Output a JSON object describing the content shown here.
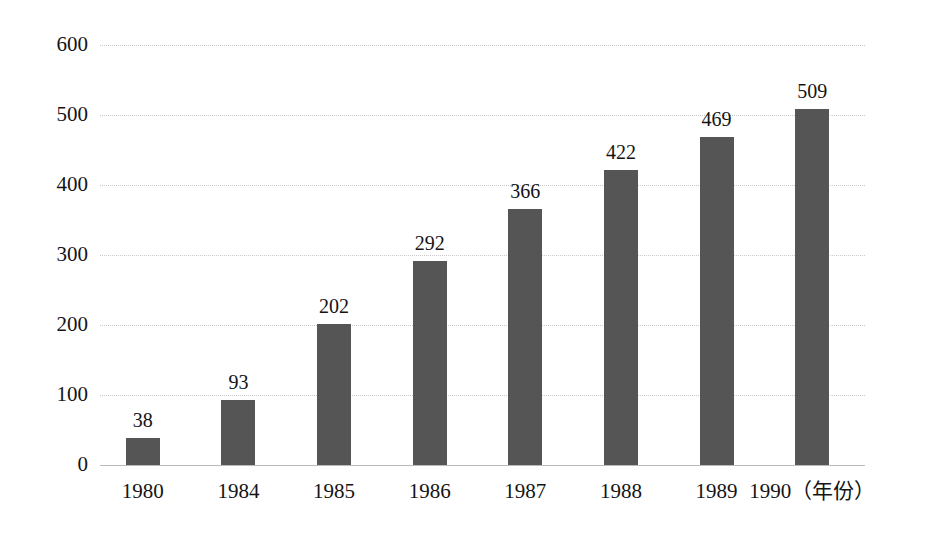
{
  "chart_data": {
    "type": "bar",
    "title": "",
    "subtitle": "",
    "xlabel": "年份",
    "ylabel": "",
    "categories": [
      "1980",
      "1984",
      "1985",
      "1986",
      "1987",
      "1988",
      "1989",
      "1990"
    ],
    "values": [
      38,
      93,
      202,
      292,
      366,
      422,
      469,
      509
    ],
    "data_labels": [
      "38",
      "93",
      "202",
      "292",
      "366",
      "422",
      "469",
      "509"
    ],
    "ylim": [
      0,
      600
    ],
    "y_ticks": [
      "600",
      "500",
      "400",
      "300",
      "200",
      "100",
      "0"
    ],
    "y_tick_values": [
      600,
      500,
      400,
      300,
      200,
      100,
      0
    ],
    "x_tick_labels": [
      "1980",
      "1984",
      "1985",
      "1986",
      "1987",
      "1988",
      "1989",
      "1990（年份）"
    ],
    "grid": true,
    "legend": false,
    "legend_position": "none",
    "bar_color": "#555555",
    "gridline_color": "#c9c9c9",
    "axis_color": "#b9b9b9",
    "text_color": "#141414",
    "background_color": "#ffffff"
  }
}
